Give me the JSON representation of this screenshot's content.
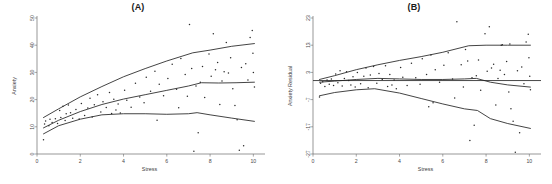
{
  "figure": {
    "width": 552,
    "height": 184,
    "background": "#ffffff",
    "ink_color": "#222222"
  },
  "chart_data": [
    {
      "type": "scatter",
      "panel_id": "A",
      "title": "(A)",
      "xlabel": "Stress",
      "ylabel": "Anxiety",
      "xlim": [
        0,
        10.4
      ],
      "ylim": [
        0,
        50
      ],
      "xticks": [
        0,
        2,
        4,
        6,
        8,
        10
      ],
      "xticklabels": [
        "0",
        "2",
        "4",
        "6",
        "8",
        "10"
      ],
      "yticks": [
        0,
        10,
        20,
        30,
        40,
        50
      ],
      "yticklabels": [
        "0",
        "10",
        "20",
        "30",
        "40",
        "50"
      ],
      "grid": false,
      "legend": "none",
      "points": [
        [
          0.3,
          5.2
        ],
        [
          0.35,
          11.0
        ],
        [
          0.4,
          12.1
        ],
        [
          0.55,
          10.4
        ],
        [
          0.6,
          12.8
        ],
        [
          0.7,
          11.6
        ],
        [
          0.85,
          13.0
        ],
        [
          0.95,
          11.2
        ],
        [
          1.05,
          16.0
        ],
        [
          1.1,
          13.4
        ],
        [
          1.2,
          17.6
        ],
        [
          1.3,
          12.3
        ],
        [
          1.35,
          14.8
        ],
        [
          1.45,
          18.0
        ],
        [
          1.55,
          15.2
        ],
        [
          1.65,
          13.1
        ],
        [
          1.8,
          16.4
        ],
        [
          1.95,
          12.9
        ],
        [
          2.05,
          18.6
        ],
        [
          2.2,
          14.2
        ],
        [
          2.35,
          16.9
        ],
        [
          2.45,
          20.5
        ],
        [
          2.55,
          13.6
        ],
        [
          2.65,
          18.1
        ],
        [
          2.8,
          21.8
        ],
        [
          2.95,
          15.4
        ],
        [
          3.05,
          19.2
        ],
        [
          3.2,
          17.1
        ],
        [
          3.35,
          22.6
        ],
        [
          3.45,
          14.9
        ],
        [
          3.55,
          20.1
        ],
        [
          3.65,
          16.2
        ],
        [
          3.75,
          18.4
        ],
        [
          3.85,
          15.1
        ],
        [
          4.05,
          23.4
        ],
        [
          4.15,
          19.8
        ],
        [
          4.35,
          17.2
        ],
        [
          4.55,
          26.0
        ],
        [
          4.75,
          21.0
        ],
        [
          4.95,
          18.8
        ],
        [
          5.05,
          28.2
        ],
        [
          5.25,
          23.1
        ],
        [
          5.45,
          30.4
        ],
        [
          5.55,
          12.4
        ],
        [
          5.65,
          25.6
        ],
        [
          5.85,
          21.4
        ],
        [
          6.05,
          27.8
        ],
        [
          6.25,
          33.0
        ],
        [
          6.45,
          23.8
        ],
        [
          6.55,
          17.0
        ],
        [
          6.65,
          35.1
        ],
        [
          6.85,
          29.2
        ],
        [
          6.95,
          21.2
        ],
        [
          7.05,
          47.6
        ],
        [
          7.15,
          31.4
        ],
        [
          7.25,
          1.0
        ],
        [
          7.35,
          25.0
        ],
        [
          7.45,
          7.8
        ],
        [
          7.55,
          26.4
        ],
        [
          7.65,
          32.2
        ],
        [
          7.75,
          20.8
        ],
        [
          7.95,
          36.8
        ],
        [
          8.05,
          28.6
        ],
        [
          8.15,
          44.2
        ],
        [
          8.25,
          31.0
        ],
        [
          8.35,
          33.6
        ],
        [
          8.45,
          18.2
        ],
        [
          8.55,
          26.8
        ],
        [
          8.65,
          30.2
        ],
        [
          8.75,
          41.0
        ],
        [
          8.85,
          29.8
        ],
        [
          8.95,
          35.4
        ],
        [
          9.05,
          24.0
        ],
        [
          9.15,
          17.8
        ],
        [
          9.25,
          12.6
        ],
        [
          9.35,
          1.4
        ],
        [
          9.45,
          31.8
        ],
        [
          9.55,
          3.0
        ],
        [
          9.65,
          33.2
        ],
        [
          9.75,
          27.2
        ],
        [
          9.85,
          42.8
        ],
        [
          9.95,
          45.4
        ],
        [
          9.98,
          37.0
        ],
        [
          10.0,
          30.0
        ],
        [
          10.05,
          24.6
        ]
      ],
      "quantile_curves": [
        {
          "name": "upper-quantile",
          "quantile": 0.9,
          "points": [
            [
              0.3,
              13.4
            ],
            [
              1.0,
              16.6
            ],
            [
              2.0,
              21.0
            ],
            [
              3.0,
              24.8
            ],
            [
              4.0,
              28.4
            ],
            [
              5.0,
              31.4
            ],
            [
              6.0,
              34.2
            ],
            [
              7.2,
              37.2
            ],
            [
              8.0,
              38.2
            ],
            [
              9.0,
              39.6
            ],
            [
              10.05,
              40.6
            ]
          ]
        },
        {
          "name": "median-quantile",
          "quantile": 0.5,
          "points": [
            [
              0.3,
              9.6
            ],
            [
              1.0,
              12.4
            ],
            [
              2.0,
              15.6
            ],
            [
              3.0,
              18.2
            ],
            [
              4.0,
              20.2
            ],
            [
              5.0,
              21.8
            ],
            [
              6.0,
              23.4
            ],
            [
              7.0,
              25.0
            ],
            [
              7.6,
              26.2
            ],
            [
              8.4,
              26.1
            ],
            [
              9.2,
              26.2
            ],
            [
              10.05,
              26.4
            ]
          ]
        },
        {
          "name": "lower-quantile",
          "quantile": 0.1,
          "points": [
            [
              0.3,
              7.4
            ],
            [
              1.0,
              10.4
            ],
            [
              2.0,
              12.8
            ],
            [
              3.0,
              14.4
            ],
            [
              4.0,
              14.8
            ],
            [
              5.0,
              14.8
            ],
            [
              6.0,
              14.6
            ],
            [
              7.0,
              14.8
            ],
            [
              7.4,
              15.2
            ],
            [
              8.0,
              14.4
            ],
            [
              9.0,
              13.2
            ],
            [
              10.05,
              12.0
            ]
          ]
        }
      ]
    },
    {
      "type": "scatter",
      "panel_id": "B",
      "title": "(B)",
      "xlabel": "Stress",
      "ylabel": "Anxiety Residual",
      "xlim": [
        0,
        10.4
      ],
      "ylim": [
        -27,
        23
      ],
      "xticks": [
        0,
        2,
        4,
        6,
        8,
        10
      ],
      "xticklabels": [
        "0",
        "2",
        "4",
        "6",
        "8",
        "10"
      ],
      "yticks": [
        -27,
        -17,
        -7,
        3,
        13,
        23
      ],
      "yticklabels": [
        "-27",
        "-17",
        "-7",
        "3",
        "13",
        "23"
      ],
      "grid": false,
      "legend": "none",
      "reference_line_y": 0,
      "points": [
        [
          0.3,
          -6.0
        ],
        [
          0.35,
          -1.0
        ],
        [
          0.45,
          -0.4
        ],
        [
          0.55,
          -2.2
        ],
        [
          0.65,
          0.2
        ],
        [
          0.75,
          -1.4
        ],
        [
          0.85,
          0.6
        ],
        [
          0.95,
          -1.8
        ],
        [
          1.05,
          2.4
        ],
        [
          1.15,
          -0.8
        ],
        [
          1.25,
          3.6
        ],
        [
          1.35,
          -2.0
        ],
        [
          1.45,
          0.8
        ],
        [
          1.55,
          3.2
        ],
        [
          1.65,
          0.0
        ],
        [
          1.75,
          -1.6
        ],
        [
          1.85,
          1.4
        ],
        [
          1.95,
          -2.4
        ],
        [
          2.05,
          3.0
        ],
        [
          2.2,
          -1.2
        ],
        [
          2.35,
          1.6
        ],
        [
          2.45,
          4.6
        ],
        [
          2.55,
          -2.6
        ],
        [
          2.65,
          2.0
        ],
        [
          2.8,
          5.2
        ],
        [
          2.95,
          -1.0
        ],
        [
          3.05,
          2.6
        ],
        [
          3.2,
          0.4
        ],
        [
          3.35,
          5.4
        ],
        [
          3.45,
          -2.2
        ],
        [
          3.55,
          2.2
        ],
        [
          3.65,
          -1.6
        ],
        [
          3.75,
          0.2
        ],
        [
          3.85,
          -3.0
        ],
        [
          4.05,
          4.8
        ],
        [
          4.15,
          1.2
        ],
        [
          4.35,
          -1.8
        ],
        [
          4.55,
          6.4
        ],
        [
          4.75,
          1.0
        ],
        [
          4.95,
          -1.4
        ],
        [
          5.05,
          8.0
        ],
        [
          5.25,
          2.2
        ],
        [
          5.35,
          -9.6
        ],
        [
          5.45,
          9.4
        ],
        [
          5.55,
          -8.2
        ],
        [
          5.65,
          4.0
        ],
        [
          5.85,
          -0.6
        ],
        [
          6.05,
          5.6
        ],
        [
          6.25,
          10.2
        ],
        [
          6.45,
          0.6
        ],
        [
          6.55,
          -6.4
        ],
        [
          6.65,
          21.6
        ],
        [
          6.85,
          5.8
        ],
        [
          6.95,
          -2.4
        ],
        [
          7.05,
          11.4
        ],
        [
          7.15,
          7.2
        ],
        [
          7.25,
          -22.0
        ],
        [
          7.35,
          1.0
        ],
        [
          7.45,
          -16.4
        ],
        [
          7.55,
          1.8
        ],
        [
          7.65,
          7.6
        ],
        [
          7.75,
          -3.6
        ],
        [
          7.95,
          17.2
        ],
        [
          8.05,
          3.4
        ],
        [
          8.15,
          19.8
        ],
        [
          8.25,
          4.6
        ],
        [
          8.35,
          6.0
        ],
        [
          8.45,
          -9.0
        ],
        [
          8.55,
          0.8
        ],
        [
          8.65,
          3.8
        ],
        [
          8.75,
          13.2
        ],
        [
          8.85,
          2.2
        ],
        [
          8.95,
          7.0
        ],
        [
          9.05,
          -4.2
        ],
        [
          9.15,
          -10.4
        ],
        [
          9.25,
          -15.0
        ],
        [
          9.35,
          -26.4
        ],
        [
          9.45,
          3.6
        ],
        [
          9.55,
          -19.2
        ],
        [
          9.65,
          5.0
        ],
        [
          9.75,
          -1.2
        ],
        [
          9.85,
          14.2
        ],
        [
          9.95,
          17.0
        ],
        [
          9.98,
          8.4
        ],
        [
          10.02,
          1.6
        ],
        [
          10.05,
          -3.4
        ],
        [
          8.7,
          13.0
        ],
        [
          9.1,
          13.4
        ]
      ],
      "quantile_curves": [
        {
          "name": "upper-quantile",
          "quantile": 0.9,
          "points": [
            [
              0.3,
              0.4
            ],
            [
              1.0,
              1.8
            ],
            [
              2.0,
              4.0
            ],
            [
              3.0,
              5.8
            ],
            [
              4.0,
              7.4
            ],
            [
              5.0,
              8.8
            ],
            [
              6.0,
              10.4
            ],
            [
              7.2,
              12.8
            ],
            [
              8.0,
              13.0
            ],
            [
              9.0,
              13.0
            ],
            [
              10.05,
              13.0
            ]
          ]
        },
        {
          "name": "median-quantile",
          "quantile": 0.5,
          "points": [
            [
              0.3,
              -0.6
            ],
            [
              1.0,
              -0.2
            ],
            [
              2.0,
              0.4
            ],
            [
              3.0,
              0.8
            ],
            [
              4.0,
              0.6
            ],
            [
              5.0,
              0.4
            ],
            [
              6.0,
              0.4
            ],
            [
              7.0,
              0.6
            ],
            [
              7.55,
              0.8
            ],
            [
              8.2,
              -0.6
            ],
            [
              9.0,
              -1.6
            ],
            [
              10.05,
              -2.4
            ]
          ]
        },
        {
          "name": "lower-quantile",
          "quantile": 0.1,
          "points": [
            [
              0.3,
              -5.6
            ],
            [
              1.0,
              -4.4
            ],
            [
              2.0,
              -3.4
            ],
            [
              2.85,
              -3.0
            ],
            [
              4.0,
              -4.6
            ],
            [
              5.0,
              -6.6
            ],
            [
              6.0,
              -8.6
            ],
            [
              7.0,
              -10.4
            ],
            [
              7.6,
              -11.0
            ],
            [
              8.2,
              -14.0
            ],
            [
              9.0,
              -15.8
            ],
            [
              10.05,
              -17.6
            ]
          ]
        }
      ]
    }
  ]
}
